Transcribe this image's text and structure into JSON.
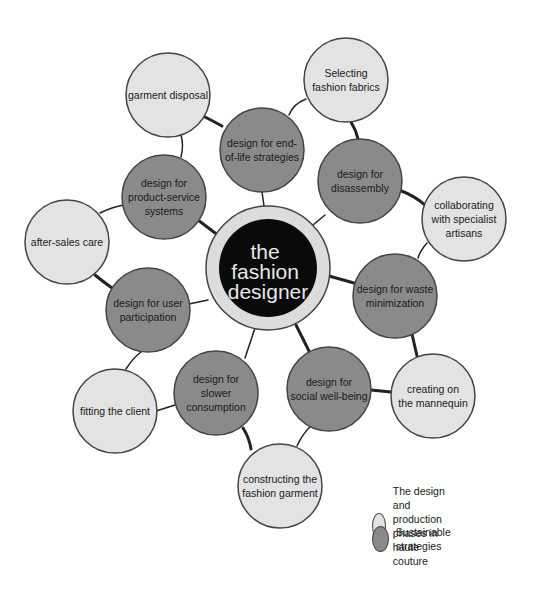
{
  "colors": {
    "phase_fill": "#e3e3e3",
    "strategy_fill": "#8a8a8a",
    "center_outer": "#dcdcdc",
    "center_inner": "#0a0a0a",
    "stroke": "#444444",
    "connector": "#222222"
  },
  "center": {
    "lines": [
      "the",
      "fashion",
      "designer"
    ]
  },
  "nodes": [
    {
      "id": "garment-disposal",
      "type": "phase",
      "lines": [
        "garment disposal"
      ]
    },
    {
      "id": "selecting-fabrics",
      "type": "phase",
      "lines": [
        "Selecting",
        "fashion fabrics"
      ]
    },
    {
      "id": "end-of-life",
      "type": "strategy",
      "lines": [
        "design for end-",
        "of-life strategies"
      ]
    },
    {
      "id": "disassembly",
      "type": "strategy",
      "lines": [
        "design for",
        "disassembly"
      ]
    },
    {
      "id": "collaborating",
      "type": "phase",
      "lines": [
        "collaborating",
        "with specialist",
        "artisans"
      ]
    },
    {
      "id": "product-service",
      "type": "strategy",
      "lines": [
        "design for",
        "product-service",
        "systems"
      ]
    },
    {
      "id": "after-sales",
      "type": "phase",
      "lines": [
        "after-sales care"
      ]
    },
    {
      "id": "waste-minimization",
      "type": "strategy",
      "lines": [
        "design for waste",
        "minimization"
      ]
    },
    {
      "id": "user-participation",
      "type": "strategy",
      "lines": [
        "design for user",
        "participation"
      ]
    },
    {
      "id": "creating-mannequin",
      "type": "phase",
      "lines": [
        "creating on",
        "the mannequin"
      ]
    },
    {
      "id": "social-well-being",
      "type": "strategy",
      "lines": [
        "design for",
        "social well-being"
      ]
    },
    {
      "id": "slower-consumption",
      "type": "strategy",
      "lines": [
        "design for",
        "slower",
        "consumption"
      ]
    },
    {
      "id": "fitting-client",
      "type": "phase",
      "lines": [
        "fitting the client"
      ]
    },
    {
      "id": "constructing-garment",
      "type": "phase",
      "lines": [
        "constructing the",
        "fashion garment"
      ]
    }
  ],
  "legend": [
    {
      "type": "phase",
      "label_line1": "The design and production",
      "label_line2": "phases in haute couture"
    },
    {
      "type": "strategy",
      "label_line1": "Sustainable strategies",
      "label_line2": ""
    }
  ]
}
